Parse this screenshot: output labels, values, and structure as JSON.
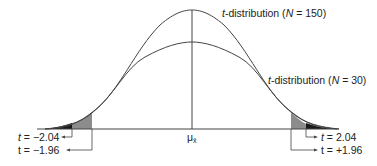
{
  "diagram": {
    "title": "",
    "curves": [
      {
        "id": "n150",
        "label_prefix": "t",
        "label_rest": "-distribution (",
        "label_n": "N",
        "label_tail": " = 150)",
        "peak_height": "tall"
      },
      {
        "id": "n30",
        "label_prefix": "t",
        "label_rest": "-distribution (",
        "label_n": "N",
        "label_tail": " = 30)",
        "peak_height": "short"
      }
    ],
    "center_label": "μ",
    "center_subscript": "x̄",
    "critical_values": {
      "left_outer": {
        "var": "t",
        "text": " = −2.04"
      },
      "left_inner": {
        "var": "t",
        "text": " = −1.96"
      },
      "right_outer": {
        "var": "t",
        "text": " = 2.04"
      },
      "right_inner": {
        "var": "t",
        "text": " = +1.96"
      }
    },
    "colors": {
      "line": "#444444",
      "dark_tail": "#1a1a1a",
      "grey_tail": "#8c8c8c"
    }
  }
}
